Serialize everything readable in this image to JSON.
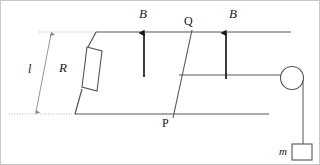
{
  "figure": {
    "width": 320,
    "height": 165,
    "background": "#ffffff",
    "border_color": "#c8c8c8",
    "line_color": "#555555",
    "arrow_color": "#1a1a1a",
    "dotted_color": "#b0b0b0",
    "labels": {
      "field_left": "B",
      "field_right": "B",
      "rod_top": "Q",
      "rod_bottom": "P",
      "resistor": "R",
      "length": "l",
      "mass": "m"
    },
    "components": {
      "resistor_name": "resistor-R",
      "pulley_name": "pulley",
      "mass_name": "hanging-mass-m",
      "rail_top_name": "rail-top",
      "rail_bottom_name": "rail-bottom",
      "rod_pq_name": "conducting-rod-PQ",
      "rod_mid_name": "connecting-rod",
      "string_name": "pulley-string",
      "dimension_name": "length-dimension-l"
    }
  }
}
